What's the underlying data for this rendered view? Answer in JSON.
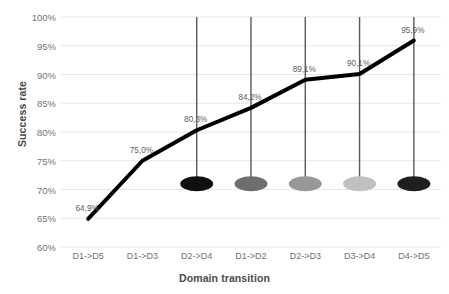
{
  "chart_data": {
    "type": "line",
    "title": "",
    "xlabel": "Domain transition",
    "ylabel": "Success rate",
    "categories": [
      "D1->D5",
      "D1->D3",
      "D2->D4",
      "D1->D2",
      "D2->D3",
      "D3->D4",
      "D4->D5"
    ],
    "values": [
      64.9,
      75.0,
      80.3,
      84.2,
      89.1,
      90.1,
      95.9
    ],
    "data_labels": [
      "64,9%",
      "75,0%",
      "80,3%",
      "84,2%",
      "89,1%",
      "90,1%",
      "95,9%"
    ],
    "ylim": [
      60,
      100
    ],
    "ytick_labels": [
      "100%",
      "95%",
      "90%",
      "85%",
      "80%",
      "75%",
      "70%",
      "65%",
      "60%"
    ],
    "ytick_values": [
      100,
      95,
      90,
      85,
      80,
      75,
      70,
      65,
      60
    ],
    "grid": true,
    "legend": "none",
    "series": [
      {
        "name": "Success rate",
        "values": [
          64.9,
          75.0,
          80.3,
          84.2,
          89.1,
          90.1,
          95.9
        ],
        "color": "#000000",
        "line_width": 4
      }
    ],
    "markers": {
      "description": "lollipop stems with ellipse heads on the last five categories",
      "stem_top_value": 100,
      "head_value": 71,
      "stem_color": "#595959",
      "items": [
        {
          "category": "D1->D2",
          "color": "#101010"
        },
        {
          "category": "D2->D3",
          "color": "#6e6e6e"
        },
        {
          "category": "D3->D4",
          "color": "#989898"
        },
        {
          "category": "D4->D5",
          "color": "#c0c0c0"
        },
        {
          "category": "D4->D5-last",
          "color": "#1f1f1f"
        }
      ]
    },
    "colors": {
      "line": "#000000",
      "grid": "#e6e6e6",
      "tick_text": "#737373",
      "axis_title_text": "#4a4a4a",
      "background": "#ffffff"
    }
  }
}
